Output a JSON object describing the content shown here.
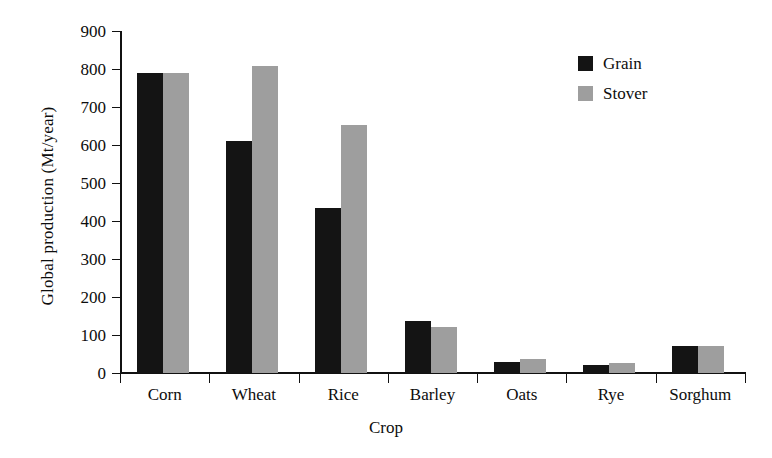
{
  "chart_data": {
    "type": "bar",
    "title": "",
    "xlabel": "Crop",
    "ylabel": "Global production (Mt/year)",
    "categories": [
      "Corn",
      "Wheat",
      "Rice",
      "Barley",
      "Oats",
      "Rye",
      "Sorghum"
    ],
    "series": [
      {
        "name": "Grain",
        "color": "#141414",
        "values": [
          790,
          610,
          435,
          137,
          30,
          20,
          70
        ]
      },
      {
        "name": "Stover",
        "color": "#9e9e9e",
        "values": [
          790,
          808,
          653,
          122,
          38,
          26,
          70
        ]
      }
    ],
    "ylim": [
      0,
      900
    ],
    "ytick_values": [
      0,
      100,
      200,
      300,
      400,
      500,
      600,
      700,
      800,
      900
    ],
    "ytick_labels": [
      "0",
      "100",
      "200",
      "300",
      "400",
      "500",
      "600",
      "700",
      "800",
      "900"
    ],
    "grid": false,
    "legend_position": "top-right",
    "legend_entries": [
      "Grain",
      "Stover"
    ]
  },
  "colors": {
    "grain": "#141414",
    "stover": "#9e9e9e",
    "axis": "#111111",
    "background": "#ffffff"
  }
}
